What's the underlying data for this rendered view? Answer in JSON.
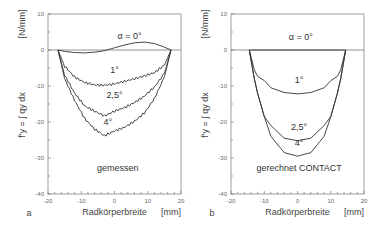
{
  "chart_data": [
    {
      "type": "line",
      "panel": "a",
      "title": "gemessen",
      "xlabel": "Radkörperbreite",
      "xunit": "[mm]",
      "ylabel": "f'y = ∫ qy dx",
      "yunit": "[N/mm]",
      "xlim": [
        -20,
        20
      ],
      "ylim": [
        -40,
        10
      ],
      "xticks": [
        -20,
        -10,
        0,
        10,
        20
      ],
      "yticks": [
        10,
        0,
        -10,
        -20,
        -30,
        -40
      ],
      "grid": false,
      "x": [
        -17,
        -15,
        -12,
        -9,
        -6,
        -3,
        0,
        3,
        6,
        9,
        12,
        15,
        17
      ],
      "series": [
        {
          "name": "α = 0°",
          "values": [
            0,
            -0.4,
            -0.7,
            -0.8,
            -0.6,
            -0.2,
            0.6,
            1.4,
            2.0,
            2.2,
            1.8,
            0.8,
            0
          ]
        },
        {
          "name": "1°",
          "values": [
            0,
            -4.5,
            -7.5,
            -9.0,
            -9.7,
            -9.8,
            -9.4,
            -8.7,
            -8.0,
            -7.2,
            -6.3,
            -4.2,
            0
          ]
        },
        {
          "name": "2,5°",
          "values": [
            0,
            -7,
            -12,
            -15.5,
            -17,
            -18.3,
            -17.0,
            -16.0,
            -14.6,
            -12.8,
            -10.3,
            -6.5,
            0
          ]
        },
        {
          "name": "4°",
          "values": [
            0,
            -8,
            -14,
            -19,
            -22,
            -23.8,
            -22.5,
            -21.5,
            -19.8,
            -17.5,
            -13.5,
            -7.5,
            0
          ]
        }
      ],
      "annotations": [
        "α = 0°",
        "1°",
        "2,5°",
        "4°",
        "gemessen"
      ]
    },
    {
      "type": "line",
      "panel": "b",
      "title": "gerechnet CONTACT",
      "xlabel": "Radkörperbreite",
      "xunit": "[mm]",
      "ylabel": "f'y = ∫ qy dx",
      "yunit": "[N/mm]",
      "xlim": [
        -20,
        20
      ],
      "ylim": [
        -40,
        10
      ],
      "xticks": [
        -20,
        -10,
        0,
        10,
        20
      ],
      "yticks": [
        10,
        0,
        -10,
        -20,
        -30,
        -40
      ],
      "grid": false,
      "x": [
        -14.5,
        -13,
        -12,
        -10,
        -8,
        -4,
        0,
        4,
        8,
        10,
        12,
        13,
        14.5
      ],
      "series": [
        {
          "name": "α = 0°",
          "values": [
            0,
            0,
            0,
            0,
            0,
            0,
            0,
            0,
            0,
            0,
            0,
            0,
            0
          ]
        },
        {
          "name": "1°",
          "values": [
            0,
            -5.5,
            -7.3,
            -8.5,
            -10.5,
            -11.8,
            -12.2,
            -11.8,
            -10.5,
            -8.5,
            -7.3,
            -5.5,
            0
          ]
        },
        {
          "name": "2,5°",
          "values": [
            0,
            -8,
            -12,
            -18.5,
            -21,
            -24.5,
            -25.2,
            -24.5,
            -21,
            -18.5,
            -12,
            -8,
            0
          ]
        },
        {
          "name": "4°",
          "values": [
            0,
            -8,
            -12,
            -18.5,
            -24,
            -28.5,
            -29.5,
            -28.5,
            -24,
            -18.5,
            -12,
            -8,
            0
          ]
        }
      ],
      "annotations": [
        "α = 0°",
        "1°",
        "2,5°",
        "4°",
        "gerechnet CONTACT"
      ]
    }
  ],
  "panels": {
    "a": {
      "letter": "a",
      "caption": "gemessen",
      "xlabel": "Radkörperbreite",
      "xunit": "[mm]",
      "yunit": "[N/mm]",
      "ylabel": "f'y = ∫ qy dx"
    },
    "b": {
      "letter": "b",
      "caption": "gerechnet CONTACT",
      "xlabel": "Radkörperbreite",
      "xunit": "[mm]",
      "yunit": "[N/mm]",
      "ylabel": "f'y = ∫ qy dx"
    }
  },
  "labels": {
    "alpha0": "α = 0°",
    "deg1": "1°",
    "deg25": "2,5°",
    "deg4": "4°"
  },
  "ticks": {
    "y": [
      "10",
      "0",
      "-10",
      "-20",
      "-30",
      "-40"
    ],
    "x": [
      "-20",
      "-10",
      "0",
      "10",
      "20"
    ]
  },
  "colors": {
    "line": "#333333",
    "axis": "#666666",
    "background": "#ffffff"
  }
}
